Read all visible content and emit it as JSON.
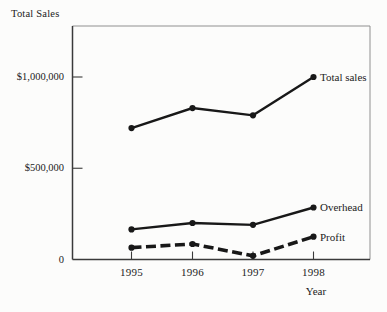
{
  "chart_data": {
    "type": "line",
    "title": "Total Sales",
    "xlabel": "Year",
    "ylabel": "Total Sales",
    "categories": [
      "1995",
      "1996",
      "1997",
      "1998"
    ],
    "series": [
      {
        "name": "Total sales",
        "label": "Total sales",
        "line_style": "solid",
        "values": [
          720000,
          830000,
          790000,
          1000000
        ]
      },
      {
        "name": "Overhead",
        "label": "Overhead",
        "line_style": "solid",
        "values": [
          165000,
          200000,
          190000,
          285000
        ]
      },
      {
        "name": "Profit",
        "label": "Profit",
        "line_style": "dashed",
        "values": [
          65000,
          85000,
          20000,
          125000
        ]
      }
    ],
    "y_ticks": [
      {
        "value": 0,
        "label": "0"
      },
      {
        "value": 500000,
        "label": "$500,000"
      },
      {
        "value": 1000000,
        "label": "$1,000,000"
      }
    ],
    "ylim": [
      0,
      1280000
    ],
    "grid": false,
    "legend_position": "line-end",
    "marker": "circle",
    "line_color": "#181818",
    "axis_color": "#3a3a3a",
    "frame_color": "#909090"
  }
}
